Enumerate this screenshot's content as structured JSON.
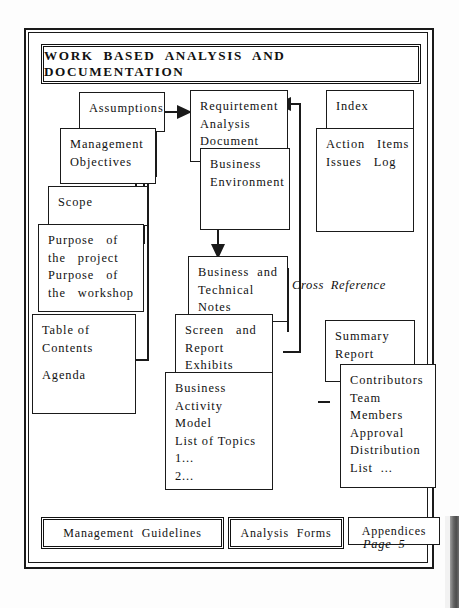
{
  "page": {
    "title": "WORK  BASED  ANALYSIS  AND  DOCUMENTATION",
    "page_label": "Page 5",
    "cross_reference_label": "Cross Reference"
  },
  "boxes": {
    "assumptions": {
      "lines": [
        "Assumptions"
      ]
    },
    "management_objectives": {
      "lines": [
        "Management",
        "Objectives"
      ]
    },
    "scope": {
      "lines": [
        "Scope"
      ]
    },
    "purpose": {
      "lines": [
        "Purpose   of",
        "the   project",
        "Purpose   of",
        "the   workshop"
      ]
    },
    "toc": {
      "lines": [
        "Table of",
        "Contents",
        "",
        "Agenda"
      ]
    },
    "requirement": {
      "lines": [
        "Requirtement",
        "Analysis",
        "Document"
      ]
    },
    "business_environment": {
      "lines": [
        "Business",
        "Environment"
      ]
    },
    "index": {
      "lines": [
        "Index"
      ]
    },
    "action_items": {
      "lines": [
        "Action   Items",
        "Issues   Log"
      ]
    },
    "business_technical_notes": {
      "lines": [
        "Business  and",
        "Technical",
        "Notes"
      ]
    },
    "screen_report_exhibits": {
      "lines": [
        "Screen   and",
        "Report",
        "Exhibits"
      ]
    },
    "business_activity_model": {
      "lines": [
        "Business",
        "Activity",
        "Model",
        "List of Topics",
        "1...",
        "2..."
      ]
    },
    "summary_report": {
      "lines": [
        "Summary",
        "Report"
      ]
    },
    "contributors": {
      "lines": [
        "Contributors",
        "Team",
        "Members",
        "Approval",
        "Distribution",
        "List  ..."
      ]
    }
  },
  "bottom_strip": {
    "management_guidelines": "Management    Guidelines",
    "analysis_forms": "Analysis   Forms",
    "appendices": "Appendices"
  },
  "colors": {
    "ink": "#1a1a1a",
    "paper": "#ffffff"
  }
}
